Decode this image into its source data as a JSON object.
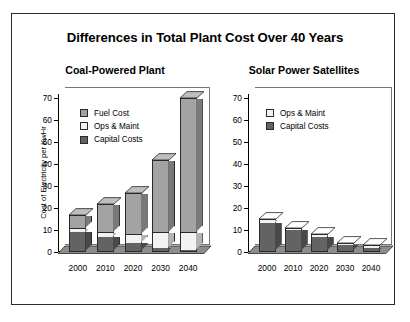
{
  "figure": {
    "title": "Differences in Total Plant Cost Over 40 Years",
    "border_color": "#2b2b2b",
    "background": "#ffffff"
  },
  "colors": {
    "fuel_cost": "#a3a3a3",
    "ops_maint": "#f2f2f2",
    "capital_costs": "#636363",
    "fuel_cost_side": "#7d7d7d",
    "ops_maint_side": "#c9c9c9",
    "capital_costs_side": "#464646",
    "fuel_cost_top": "#bdbdbd",
    "ops_maint_top": "#ffffff",
    "capital_costs_top": "#7a7a7a",
    "outline": "#2a2a2a",
    "text": "#000000"
  },
  "axis": {
    "y_title": "Cost of Electricity per KwHr",
    "ticks": [
      0,
      10,
      20,
      30,
      40,
      50,
      60,
      70
    ],
    "tick_labels": [
      "0",
      "10",
      "20",
      "30",
      "40",
      "50",
      "60",
      "70"
    ],
    "ymin": 0,
    "ymax": 72
  },
  "chart_data": [
    {
      "type": "bar",
      "subtype": "stacked-3d-column",
      "title": "Coal-Powered Plant",
      "xlabel": "",
      "ylabel": "Cost of Electricity per KwHr",
      "ylim": [
        0,
        72
      ],
      "yticks": [
        0,
        10,
        20,
        30,
        40,
        50,
        60,
        70
      ],
      "grid": false,
      "legend_position": "top-left",
      "categories": [
        "2000",
        "2010",
        "2020",
        "2030",
        "2040"
      ],
      "series": [
        {
          "name": "Capital Costs",
          "color": "#636363",
          "values": [
            9,
            7,
            4,
            2,
            1
          ]
        },
        {
          "name": "Ops & Maint",
          "color": "#f2f2f2",
          "values": [
            2,
            2,
            4,
            7,
            8
          ]
        },
        {
          "name": "Fuel Cost",
          "color": "#a3a3a3",
          "values": [
            6,
            13,
            19,
            33,
            61
          ]
        }
      ],
      "totals": [
        17,
        22,
        27,
        42,
        70
      ]
    },
    {
      "type": "bar",
      "subtype": "stacked-3d-column",
      "title": "Solar Power Satellites",
      "xlabel": "",
      "ylabel": "",
      "ylim": [
        0,
        72
      ],
      "yticks": [
        0,
        10,
        20,
        30,
        40,
        50,
        60,
        70
      ],
      "grid": false,
      "legend_position": "top-left",
      "categories": [
        "2000",
        "2010",
        "2020",
        "2030",
        "2040"
      ],
      "series": [
        {
          "name": "Capital Costs",
          "color": "#636363",
          "values": [
            13,
            10,
            7,
            3,
            2
          ]
        },
        {
          "name": "Ops & Maint",
          "color": "#f2f2f2",
          "values": [
            2,
            1,
            1,
            1,
            1
          ]
        }
      ],
      "totals": [
        15,
        11,
        8,
        4,
        3
      ]
    }
  ],
  "panels": {
    "coal": {
      "title": "Coal-Powered Plant",
      "legend": [
        {
          "label": "Fuel Cost",
          "color": "#a3a3a3"
        },
        {
          "label": "Ops & Maint",
          "color": "#f2f2f2"
        },
        {
          "label": "Capital Costs",
          "color": "#636363"
        }
      ],
      "categories": [
        "2000",
        "2010",
        "2020",
        "2030",
        "2040"
      ]
    },
    "solar": {
      "title": "Solar Power Satellites",
      "legend": [
        {
          "label": "Ops & Maint",
          "color": "#f2f2f2"
        },
        {
          "label": "Capital Costs",
          "color": "#636363"
        }
      ],
      "categories": [
        "2000",
        "2010",
        "2020",
        "2030",
        "2040"
      ]
    }
  }
}
